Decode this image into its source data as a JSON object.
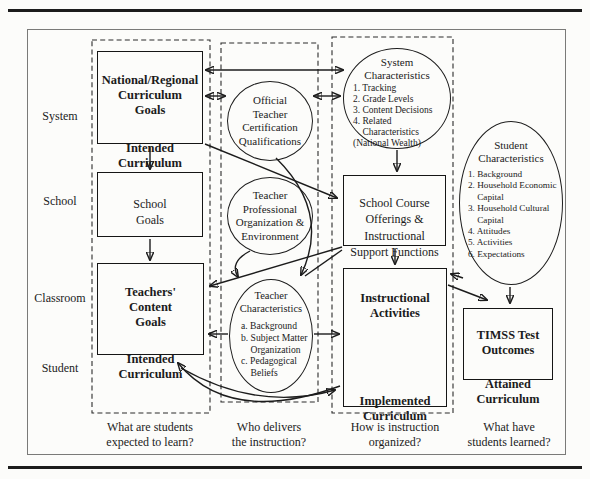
{
  "colors": {
    "ink": "#1b1b1b",
    "paper": "#fcfcfa"
  },
  "row_labels": [
    "System",
    "School",
    "Classroom",
    "Student"
  ],
  "boxes": {
    "national": {
      "title": [
        "National/Regional",
        "Curriculum",
        "Goals"
      ],
      "subtitle": [
        "Intended",
        "Curriculum"
      ]
    },
    "school_goals": {
      "title": [
        "School",
        "Goals"
      ]
    },
    "teachers": {
      "title": [
        "Teachers'",
        "Content",
        "Goals"
      ],
      "subtitle": [
        "Intended",
        "Curriculum"
      ]
    },
    "school_course": {
      "title": [
        "School Course",
        "Offerings &",
        "Instructional",
        "Support Functions"
      ]
    },
    "instructional": {
      "title": [
        "Instructional",
        "Activities"
      ],
      "subtitle": [
        "Implemented",
        "Curriculum"
      ]
    },
    "timss": {
      "title": [
        "TIMSS Test",
        "Outcomes"
      ],
      "subtitle": [
        "Attained",
        "Curriculum"
      ]
    }
  },
  "ellipses": {
    "official_cert": {
      "title": [
        "Official",
        "Teacher",
        "Certification",
        "Qualifications"
      ]
    },
    "teacher_prof": {
      "title": [
        "Teacher",
        "Professional",
        "Organization &",
        "Environment"
      ]
    },
    "system_char": {
      "title": [
        "System",
        "Characteristics"
      ],
      "items": [
        "1. Tracking",
        "2. Grade Levels",
        "3. Content Decisions",
        "4. Related",
        "    Characteristics",
        "(National Wealth)"
      ]
    },
    "teacher_char": {
      "title": [
        "Teacher",
        "Characteristics"
      ],
      "items": [
        "a. Background",
        "b. Subject Matter",
        "    Organization",
        "c. Pedagogical",
        "    Beliefs"
      ]
    },
    "student_char": {
      "title": [
        "Student",
        "Characteristics"
      ],
      "items": [
        "1. Background",
        "2. Household Economic",
        "    Capital",
        "3. Household Cultural",
        "    Capital",
        "4. Attitudes",
        "5. Activities",
        "6. Expectations"
      ]
    }
  },
  "captions": {
    "col1": [
      "What are students",
      "expected to learn?"
    ],
    "col2": [
      "Who delivers",
      "the instruction?"
    ],
    "col3": [
      "How is instruction",
      "organized?"
    ],
    "col4": [
      "What have",
      "students learned?"
    ]
  }
}
